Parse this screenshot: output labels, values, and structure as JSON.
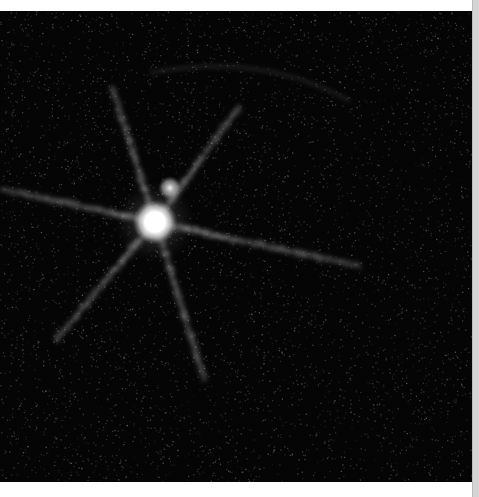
{
  "image": {
    "description": "Astronomical image of a bright point source with diffraction spikes and a faint companion on a noisy black background",
    "background_color": "#050505",
    "primary_source": {
      "x": 155,
      "y": 211,
      "radius": 14,
      "color": "#ffffff"
    },
    "secondary_source": {
      "x": 170,
      "y": 177,
      "radius": 6,
      "color": "#e6e6e6"
    },
    "spikes": [
      {
        "name": "upper-left",
        "to": [
          112,
          75
        ]
      },
      {
        "name": "upper-right",
        "to": [
          240,
          95
        ]
      },
      {
        "name": "left",
        "to": [
          0,
          178
        ]
      },
      {
        "name": "right",
        "to": [
          360,
          255
        ]
      },
      {
        "name": "lower-left",
        "to": [
          55,
          330
        ]
      },
      {
        "name": "lower-right",
        "to": [
          205,
          370
        ]
      }
    ]
  },
  "scrollbar": {
    "color": "#d4d4d4"
  }
}
